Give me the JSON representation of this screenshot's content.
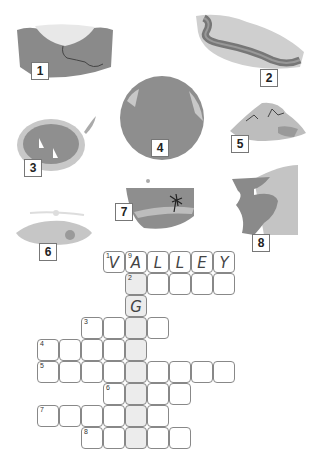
{
  "pictures": [
    {
      "id": 1,
      "label": "1",
      "depicts": "canyon"
    },
    {
      "id": 2,
      "label": "2",
      "depicts": "river"
    },
    {
      "id": 3,
      "label": "3",
      "depicts": "lake"
    },
    {
      "id": 4,
      "label": "4",
      "depicts": "ocean"
    },
    {
      "id": 5,
      "label": "5",
      "depicts": "mountain"
    },
    {
      "id": 6,
      "label": "6",
      "depicts": "plain"
    },
    {
      "id": 7,
      "label": "7",
      "depicts": "island"
    },
    {
      "id": 8,
      "label": "8",
      "depicts": "cliff"
    }
  ],
  "crossword": {
    "cell_size": 22,
    "shaded_column": 4,
    "rows": [
      {
        "row": 0,
        "start_col": 3,
        "length": 6,
        "clue_number": "1",
        "letters": [
          "V",
          "A",
          "L",
          "L",
          "E",
          "Y"
        ],
        "second_number": {
          "col": 4,
          "value": "9"
        }
      },
      {
        "row": 1,
        "start_col": 4,
        "length": 5,
        "clue_number": "2",
        "letters": [
          "",
          "",
          "",
          "",
          ""
        ]
      },
      {
        "row": 2,
        "start_col": 4,
        "length": 1,
        "clue_number": "",
        "letters": [
          "G"
        ]
      },
      {
        "row": 3,
        "start_col": 2,
        "length": 4,
        "clue_number": "3",
        "letters": [
          "",
          "",
          "",
          ""
        ]
      },
      {
        "row": 4,
        "start_col": 0,
        "length": 5,
        "clue_number": "4",
        "letters": [
          "",
          "",
          "",
          "",
          ""
        ]
      },
      {
        "row": 5,
        "start_col": 0,
        "length": 9,
        "clue_number": "5",
        "letters": [
          "",
          "",
          "",
          "",
          "",
          "",
          "",
          "",
          ""
        ]
      },
      {
        "row": 6,
        "start_col": 3,
        "length": 4,
        "clue_number": "6",
        "letters": [
          "",
          "",
          "",
          ""
        ]
      },
      {
        "row": 7,
        "start_col": 0,
        "length": 6,
        "clue_number": "7",
        "letters": [
          "",
          "",
          "",
          "",
          "",
          ""
        ]
      },
      {
        "row": 8,
        "start_col": 2,
        "length": 5,
        "clue_number": "8",
        "letters": [
          "",
          "",
          "",
          "",
          ""
        ]
      }
    ]
  }
}
